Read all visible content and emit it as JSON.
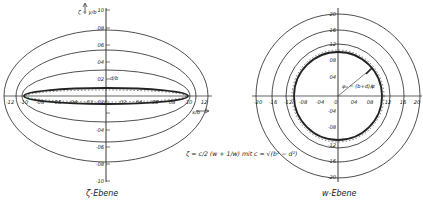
{
  "figure": {
    "left_panel": {
      "caption": "ζ-Ebene",
      "x_axis_label": "x/b",
      "y_axis_label": "ζ = y/b",
      "annotation": "d/b",
      "x_ticks": [
        "-1.2",
        "-1.0",
        "-0.8",
        "-0.6",
        "-0.4",
        "-0.2",
        "0",
        "0.2",
        "0.4",
        "0.6",
        "0.8",
        "1.0",
        "1.2"
      ],
      "x_tick_text": [
        "-12",
        "-10",
        "-08",
        "-06",
        "-04",
        "-02",
        "0",
        "02",
        "04",
        "06",
        "08",
        "10",
        "12"
      ],
      "y_tick_text": [
        "10",
        "08",
        "06",
        "04",
        "02",
        "-02",
        "-04",
        "-06",
        "-08",
        "-10"
      ]
    },
    "right_panel": {
      "caption": "w-Ebene",
      "annotation_phi": "φ₀ = (b+d)/c",
      "annotation_psi": "ψ",
      "x_tick_text": [
        "-20",
        "-16",
        "-12",
        "-08",
        "-04",
        "0",
        "04",
        "08",
        "12",
        "16",
        "20"
      ],
      "y_tick_text": [
        "20",
        "16",
        "12",
        "08",
        "04",
        "-04",
        "-08",
        "-12",
        "-16",
        "-20"
      ]
    },
    "formula": {
      "text": "ζ = c/2 (w + 1/w)  mit c = √(b² − d²)"
    }
  }
}
